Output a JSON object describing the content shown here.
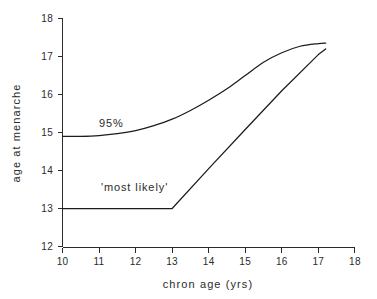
{
  "chart_data": {
    "type": "line",
    "title": "",
    "subtitle": "",
    "xlabel": "chron age (yrs)",
    "ylabel": "age at menarche",
    "xlim": [
      10,
      18
    ],
    "ylim": [
      12,
      18
    ],
    "xticks": [
      10,
      11,
      12,
      13,
      14,
      15,
      16,
      17,
      18
    ],
    "yticks": [
      12,
      13,
      14,
      15,
      16,
      17,
      18
    ],
    "xtick_labels": [
      "10",
      "11",
      "12",
      "13",
      "14",
      "15",
      "16",
      "17",
      "18"
    ],
    "ytick_labels": [
      "12",
      "13",
      "14",
      "15",
      "16",
      "17",
      "18"
    ],
    "grid": false,
    "legend": "none",
    "line_color": "#1c1c1c",
    "axis_color": "#2b2b2b",
    "background_color": "#ffffff",
    "annotations": [
      {
        "id": "upper-curve-label",
        "text": "95%",
        "x": 11.0,
        "y": 15.15
      },
      {
        "id": "lower-curve-label",
        "text": "'most likely'",
        "x": 11.05,
        "y": 13.45
      }
    ],
    "series": [
      {
        "name": "95%",
        "style": "smooth-curve",
        "x": [
          10.0,
          10.5,
          11.0,
          11.5,
          12.0,
          12.5,
          13.0,
          13.5,
          14.0,
          14.5,
          15.0,
          15.5,
          16.0,
          16.5,
          17.0,
          17.2
        ],
        "values": [
          14.9,
          14.9,
          14.92,
          14.97,
          15.05,
          15.18,
          15.35,
          15.58,
          15.85,
          16.15,
          16.5,
          16.85,
          17.1,
          17.27,
          17.34,
          17.35
        ]
      },
      {
        "name": "'most likely'",
        "style": "piecewise-linear",
        "x": [
          10.0,
          11.0,
          12.0,
          13.0,
          14.0,
          15.0,
          16.0,
          17.0,
          17.2
        ],
        "values": [
          13.0,
          13.0,
          13.0,
          13.0,
          14.05,
          15.08,
          16.1,
          17.05,
          17.2
        ]
      }
    ]
  }
}
